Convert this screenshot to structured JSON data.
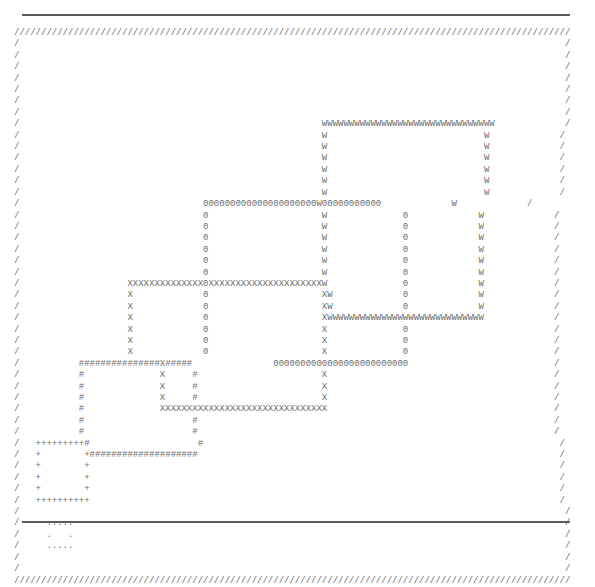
{
  "page": {
    "background_color": "#ffffff",
    "ink_color": "#6d6d6d",
    "rule_color": "#5b5b5b",
    "width_px": 595,
    "height_px": 536
  },
  "rules": {
    "top_label": "top-horizontal-rule",
    "bottom_label": "bottom-horizontal-rule"
  },
  "frame": {
    "character": "/",
    "description": "outer border drawn with slash characters"
  },
  "shapes": [
    {
      "name": "rect-w",
      "character": "W",
      "order": 1
    },
    {
      "name": "rect-zero",
      "character": "0",
      "order": 2
    },
    {
      "name": "rect-x",
      "character": "X",
      "order": 3
    },
    {
      "name": "rect-hash",
      "character": "#",
      "order": 4
    },
    {
      "name": "rect-plus",
      "character": "+",
      "order": 5
    },
    {
      "name": "rect-dot",
      "character": ".",
      "order": 6
    }
  ],
  "ascii_art": {
    "columns": 103,
    "rows": 43,
    "lines": [
      "///////////////////////////////////////////////////////////////////////////////////////////////////////",
      "/                                                                                                     /",
      "/                                                                                                     /",
      "/                                                                                                     /",
      "/                                                                                                     /",
      "/                                                                                                     /",
      "/                                                                                                     /",
      "/                                                                                                     /",
      "/                                                        WWWWWWWWWWWWWWWWWWWWWWWWWWWWWWWW             /",
      "/                                                        W                             W             /",
      "/                                                        W                             W             /",
      "/                                                        W                             W             /",
      "/                                                        W                             W             /",
      "/                                                        W                             W             /",
      "/                                                        W                             W             /",
      "/                                  000000000000000000000W00000000000             W             /",
      "/                                  0                     W              0             W             /",
      "/                                  0                     W              0             W             /",
      "/                                  0                     W              0             W             /",
      "/                                  0                     W              0             W             /",
      "/                                  0                     W              0             W             /",
      "/                                  0                     W              0             W             /",
      "/                    XXXXXXXXXXXXXX0XXXXXXXXXXXXXXXXXXXXXW              0             W             /",
      "/                    X             0                     XW             0             W             /",
      "/                    X             0                     XW             0             W             /",
      "/                    X             0                     XWWWWWWWWWWWWWWWWWWWWWWWWWWWWW             /",
      "/                    X             0                     X              0                           /",
      "/                    X             0                     X              0                           /",
      "/                    X             0                     X              0                           /",
      "/           ###############X#####               0000000000000000000000000                           /",
      "/           #              X     #                       X                                          /",
      "/           #              X     #                       X                                          /",
      "/           #              X     #                       X                                          /",
      "/           #              XXXXXXXXXXXXXXXXXXXXXXXXXXXXXXX                                          /",
      "/           #                    #                                                                  /",
      "/           #                    #                                                                  /",
      "/   +++++++++#                    #                                                                  /",
      "/   +        +####################                                                                   /",
      "/   +        +                                                                                       /",
      "/   +        +                                                                                       /",
      "/   +        +                                                                                       /",
      "/   ++++++++++                                                                                       /",
      "/                                                                                                     /",
      "/     .....                                                                                           /",
      "/     .   .                                                                                           /",
      "/     .....                                                                                           /",
      "/                                                                                                     /",
      "/                                                                                                     /",
      "///////////////////////////////////////////////////////////////////////////////////////////////////////"
    ]
  }
}
